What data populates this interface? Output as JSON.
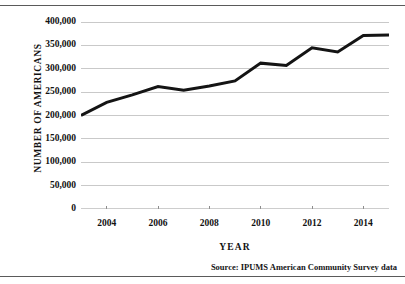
{
  "figure": {
    "source_note": "Source:  IPUMS American Community Survey data"
  },
  "chart_data": {
    "type": "line",
    "title": "",
    "subtitle": "",
    "xlabel": "YEAR",
    "ylabel": "NUMBER OF AMERICANS",
    "x": [
      2003,
      2004,
      2005,
      2006,
      2007,
      2008,
      2009,
      2010,
      2011,
      2012,
      2013,
      2014,
      2015
    ],
    "values": [
      200000,
      228000,
      244000,
      262000,
      254000,
      263000,
      274000,
      312000,
      307000,
      345000,
      336000,
      371000,
      372000
    ],
    "series": [
      {
        "name": "Number of Americans",
        "values": [
          200000,
          228000,
          244000,
          262000,
          254000,
          263000,
          274000,
          312000,
          307000,
          345000,
          336000,
          371000,
          372000
        ]
      }
    ],
    "xlim": [
      2003,
      2015
    ],
    "ylim": [
      0,
      400000
    ],
    "xtick_values": [
      2004,
      2006,
      2008,
      2010,
      2012,
      2014
    ],
    "xtick_labels": [
      "2004",
      "2006",
      "2008",
      "2010",
      "2012",
      "2014"
    ],
    "xminor_tick_values": [
      2004,
      2006,
      2008,
      2010,
      2012,
      2014
    ],
    "ytick_values": [
      0,
      50000,
      100000,
      150000,
      200000,
      250000,
      300000,
      350000,
      400000
    ],
    "ytick_labels": [
      "0",
      "50,000",
      "100,000",
      "150,000",
      "200,000",
      "250,000",
      "300,000",
      "350,000",
      "400,000"
    ],
    "grid": "horizontal",
    "grid_color": "#c9c9c9",
    "line_color": "#141414",
    "line_width": 3,
    "legend": "none",
    "legend_position": "none",
    "annotations": []
  }
}
